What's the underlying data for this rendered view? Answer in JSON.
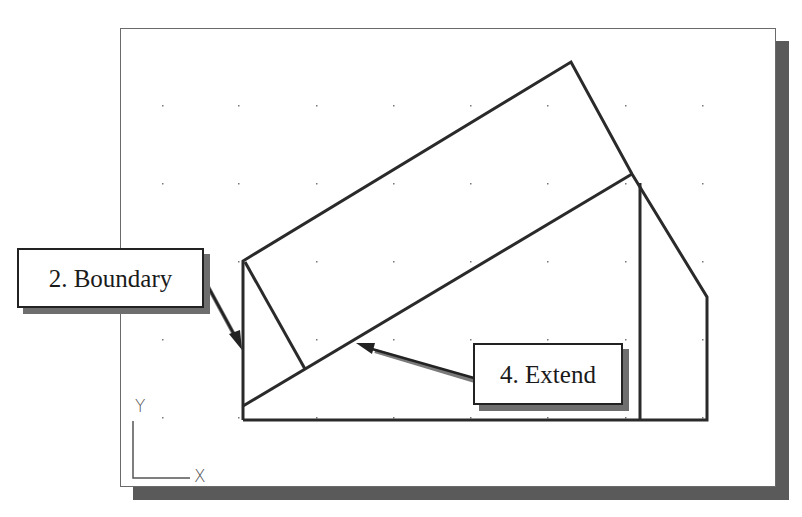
{
  "callouts": {
    "boundary": {
      "label": "2. Boundary"
    },
    "extend": {
      "label": "4. Extend"
    }
  },
  "ucs_icon": {
    "y_label": "Y",
    "x_label": "X"
  },
  "colors": {
    "line": "#2a2a2a",
    "shadow": "#5a5a5a",
    "grid_dot": "#777777",
    "background": "#ffffff"
  },
  "grid": {
    "x": [
      162,
      238,
      316,
      393,
      470,
      547,
      625,
      702
    ],
    "y": [
      105,
      183,
      261,
      339,
      417
    ]
  }
}
